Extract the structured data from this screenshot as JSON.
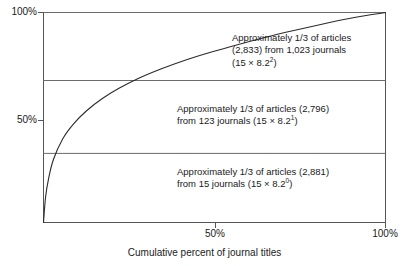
{
  "chart_data": {
    "type": "line",
    "title": "",
    "subtitle": "",
    "xlabel": "Cumulative percent of journal titles",
    "ylabel": "",
    "xlim": [
      0,
      100
    ],
    "ylim": [
      0,
      100
    ],
    "grid": "horizontal",
    "legend": "none",
    "x_ticks": [
      {
        "value": 50,
        "label": "50%"
      },
      {
        "value": 100,
        "label": "100%"
      }
    ],
    "y_ticks": [
      {
        "value": 50,
        "label": "50%"
      },
      {
        "value": 100,
        "label": "100%"
      }
    ],
    "gridlines_y": [
      32.9,
      67.6
    ],
    "series": [
      {
        "name": "Cumulative percent of articles",
        "x": [
          0,
          0.6,
          1.5,
          2.9,
          5.6,
          8.8,
          12.6,
          17.0,
          22.2,
          28.0,
          34.5,
          41.6,
          49.1,
          57.0,
          65.0,
          73.2,
          81.4,
          89.0,
          94.8,
          100
        ],
        "y": [
          0,
          12.0,
          21.0,
          30.0,
          39.8,
          47.0,
          53.2,
          58.8,
          64.0,
          68.8,
          73.2,
          77.4,
          81.2,
          84.8,
          88.2,
          91.4,
          94.4,
          97.0,
          98.7,
          100
        ]
      }
    ],
    "annotations": [
      {
        "id": "top",
        "lines": [
          {
            "text": "Approximately 1/3 of articles"
          },
          {
            "text": "(2,833) from 1,023 journals"
          },
          {
            "text_before": "(15 × 8.2",
            "sup": "2",
            "text_after": ")"
          }
        ],
        "articles": 2833,
        "journals": 1023,
        "formula": "15 × 8.2^2"
      },
      {
        "id": "middle",
        "lines": [
          {
            "text": "Approximately 1/3 of articles (2,796)"
          },
          {
            "text_before": "from 123 journals (15 × 8.2",
            "sup": "1",
            "text_after": ")"
          }
        ],
        "articles": 2796,
        "journals": 123,
        "formula": "15 × 8.2^1"
      },
      {
        "id": "bottom",
        "lines": [
          {
            "text": "Approximately 1/3 of articles (2,881)"
          },
          {
            "text_before": "from 15 journals (15 × 8.2",
            "sup": "0",
            "text_after": ")"
          }
        ],
        "articles": 2881,
        "journals": 15,
        "formula": "15 × 8.2^0"
      }
    ],
    "colors": {
      "axis": "#555555",
      "gridline": "#6b6b6b",
      "curve": "#2b2b2b",
      "text": "#1a1a1a",
      "background": "#ffffff"
    }
  },
  "axes": {
    "x_title": "Cumulative percent of journal titles",
    "x_tick_50": "50%",
    "x_tick_100": "100%",
    "y_tick_50": "50%",
    "y_tick_100": "100%"
  },
  "annotations": {
    "top": {
      "line1": "Approximately 1/3 of articles",
      "line2": "(2,833) from 1,023 journals",
      "line3_before": "(15 × 8.2",
      "line3_sup": "2",
      "line3_after": ")"
    },
    "middle": {
      "line1": "Approximately 1/3 of articles (2,796)",
      "line2_before": "from 123 journals (15 × 8.2",
      "line2_sup": "1",
      "line2_after": ")"
    },
    "bottom": {
      "line1": "Approximately 1/3 of articles (2,881)",
      "line2_before": "from 15 journals (15 × 8.2",
      "line2_sup": "0",
      "line2_after": ")"
    }
  }
}
